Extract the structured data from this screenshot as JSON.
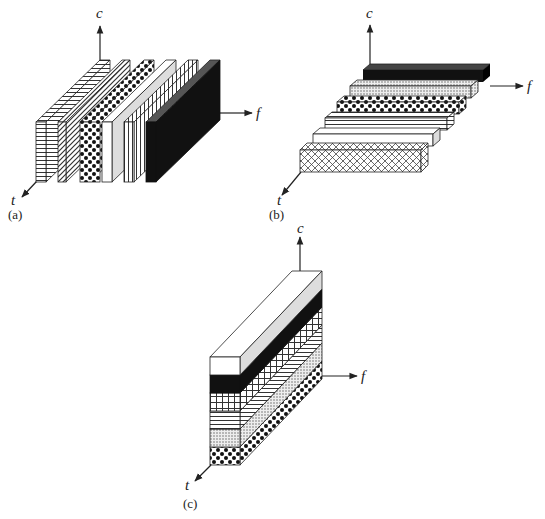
{
  "figure": {
    "panels": [
      {
        "id": "a",
        "caption": "(a)",
        "axes": {
          "vertical": "c",
          "horizontal": "f",
          "depth": "t"
        },
        "arrangement": "vertical slabs side by side along f",
        "blocks": [
          {
            "pattern": "horizontal-lines"
          },
          {
            "pattern": "diagonal-lines"
          },
          {
            "pattern": "checker-dots"
          },
          {
            "pattern": "white"
          },
          {
            "pattern": "vertical-lines"
          },
          {
            "pattern": "solid-black"
          }
        ]
      },
      {
        "id": "b",
        "caption": "(b)",
        "axes": {
          "vertical": "c",
          "horizontal": "f",
          "depth": "t"
        },
        "arrangement": "horizontal bars stacked along t",
        "blocks": [
          {
            "pattern": "solid-black"
          },
          {
            "pattern": "fine-dots"
          },
          {
            "pattern": "checker-dots"
          },
          {
            "pattern": "horizontal-lines"
          },
          {
            "pattern": "white"
          },
          {
            "pattern": "crosshatch-diagonal"
          }
        ]
      },
      {
        "id": "c",
        "caption": "(c)",
        "axes": {
          "vertical": "c",
          "horizontal": "f",
          "depth": "t"
        },
        "arrangement": "bars stacked along c",
        "blocks": [
          {
            "pattern": "white"
          },
          {
            "pattern": "solid-black"
          },
          {
            "pattern": "grid"
          },
          {
            "pattern": "horizontal-lines"
          },
          {
            "pattern": "fine-dots"
          },
          {
            "pattern": "checker-dots"
          }
        ]
      }
    ]
  },
  "labels": {
    "a": {
      "c": "c",
      "f": "f",
      "t": "t",
      "caption": "(a)"
    },
    "b": {
      "c": "c",
      "f": "f",
      "t": "t",
      "caption": "(b)"
    },
    "c": {
      "c": "c",
      "f": "f",
      "t": "t",
      "caption": "(c)"
    }
  },
  "colors": {
    "ink": "#222222",
    "black_block": "#111111",
    "side_shade": "#d8d8d8",
    "background": "#ffffff"
  }
}
